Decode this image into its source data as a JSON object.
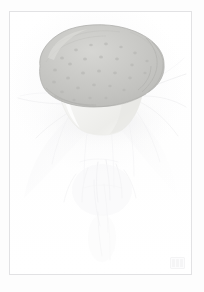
{
  "artwork": {
    "title": "Mushroom study",
    "medium": "watercolour and pencil on paper",
    "subject_label": "mushroom",
    "background_color": "#ffffff",
    "paper_color": "#fefefe",
    "frame_color": "#e2e2e4",
    "cap_color": "#c9c9c7",
    "cap_shadow_color": "#b9b9b6",
    "cap_highlight_color": "#d8d8d5",
    "cap_outline_color": "#adadaa",
    "stem_color": "#f4f4f2",
    "stem_shadow_color": "#e9e9e6",
    "pencil_color": "#e8e8ea",
    "wisp_color": "#f0f0f1"
  },
  "parts": {
    "cap_name": "mushroom-cap",
    "cap_texture_name": "cap-speckles",
    "stem_name": "mushroom-stem",
    "wisps_name": "radiating-wisps",
    "pencil_name": "pencil-understudy",
    "shadow_name": "cast-shadow"
  },
  "stamp": {
    "label": "collection-stamp",
    "text": "",
    "glyph_count": 3
  },
  "frame": {
    "label": "ruled-border"
  },
  "canvas": {
    "width": "204",
    "height": "292"
  }
}
